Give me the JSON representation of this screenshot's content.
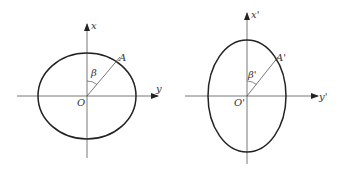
{
  "figures": [
    {
      "id": "original",
      "labels": {
        "vertical_axis": "x",
        "horizontal_axis": "y",
        "origin": "O",
        "point": "A",
        "angle": "β"
      }
    },
    {
      "id": "transformed",
      "labels": {
        "vertical_axis": "x'",
        "horizontal_axis": "y'",
        "origin": "O'",
        "point": "A'",
        "angle": "β'"
      }
    }
  ]
}
